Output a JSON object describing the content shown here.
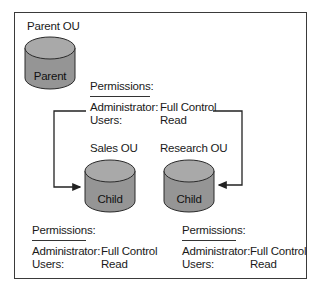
{
  "diagram": {
    "type": "ou-permission-inheritance",
    "parent": {
      "title": "Parent OU",
      "label": "Parent",
      "permissions": {
        "heading": "Permissions:",
        "rows": [
          {
            "principal": "Administrator:",
            "right": "Full Control"
          },
          {
            "principal": "Users:",
            "right": "Read"
          }
        ]
      }
    },
    "children": [
      {
        "title": "Sales OU",
        "label": "Child",
        "permissions": {
          "heading": "Permissions:",
          "rows": [
            {
              "principal": "Administrator:",
              "right": "Full Control"
            },
            {
              "principal": "Users:",
              "right": "Read"
            }
          ]
        }
      },
      {
        "title": "Research OU",
        "label": "Child",
        "permissions": {
          "heading": "Permissions:",
          "rows": [
            {
              "principal": "Administrator:",
              "right": "Full Control"
            },
            {
              "principal": "Users:",
              "right": "Read"
            }
          ]
        }
      }
    ],
    "edges": [
      {
        "from": "parent-permissions",
        "to": "Sales OU",
        "style": "elbow-arrow"
      },
      {
        "from": "parent-permissions",
        "to": "Research OU",
        "style": "elbow-arrow"
      }
    ],
    "colors": {
      "cylinder_fill": "#9a9a9a",
      "cylinder_top": "#a8a8a8",
      "cylinder_stroke": "#2a2a2a",
      "line": "#222222",
      "frame": "#3a3a3a"
    }
  }
}
